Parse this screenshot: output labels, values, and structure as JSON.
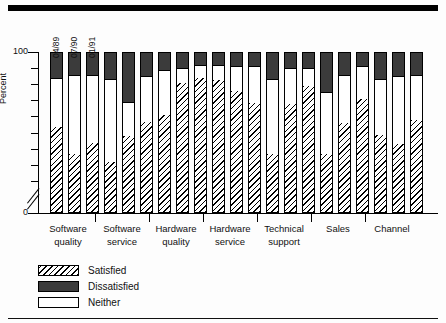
{
  "figure": {
    "y_axis_title": "Percent",
    "y_labels": [
      "100",
      "0"
    ],
    "series_dates": [
      "04/89",
      "07/90",
      "01/91"
    ],
    "legend": [
      {
        "key": "satisfied",
        "label": "Satisfied"
      },
      {
        "key": "dissatisfied",
        "label": "Dissatisfied"
      },
      {
        "key": "neither",
        "label": "Neither"
      }
    ],
    "colors": {
      "satisfied": "#000000",
      "dissatisfied": "#3b3b3b",
      "neither": "#ffffff",
      "axis": "#000000"
    }
  },
  "chart_data": {
    "type": "bar",
    "title": "",
    "subtitle": "",
    "xlabel": "",
    "ylabel": "Percent",
    "ylim": [
      0,
      100
    ],
    "y_ticks": [
      0,
      100
    ],
    "y_axis_broken": true,
    "grid": false,
    "stacked": true,
    "stack_total": 100,
    "legend_position": "below-left",
    "categories": [
      "Software quality",
      "Software service",
      "Hardware quality",
      "Hardware service",
      "Technical support",
      "Sales",
      "Channel"
    ],
    "category_lines": [
      [
        "Software",
        "quality"
      ],
      [
        "Software",
        "service"
      ],
      [
        "Hardware",
        "quality"
      ],
      [
        "Hardware",
        "service"
      ],
      [
        "Technical",
        "support"
      ],
      [
        "Sales",
        ""
      ],
      [
        "Channel",
        ""
      ]
    ],
    "sub_categories": [
      "04/89",
      "07/90",
      "01/91"
    ],
    "series": [
      {
        "name": "Satisfied",
        "values": [
          [
            53,
            36,
            43
          ],
          [
            31,
            47,
            56
          ],
          [
            60,
            80,
            83
          ],
          [
            82,
            75,
            68
          ],
          [
            36,
            67,
            78
          ],
          [
            36,
            55,
            70
          ],
          [
            48,
            42,
            57
          ]
        ]
      },
      {
        "name": "Neither",
        "values": [
          [
            31,
            50,
            43
          ],
          [
            52,
            22,
            29
          ],
          [
            29,
            10,
            9
          ],
          [
            10,
            16,
            23
          ],
          [
            47,
            23,
            12
          ],
          [
            39,
            31,
            21
          ],
          [
            35,
            43,
            29
          ]
        ]
      },
      {
        "name": "Dissatisfied",
        "values": [
          [
            16,
            14,
            14
          ],
          [
            17,
            31,
            15
          ],
          [
            11,
            10,
            8
          ],
          [
            8,
            9,
            9
          ],
          [
            17,
            10,
            10
          ],
          [
            25,
            14,
            9
          ],
          [
            17,
            15,
            14
          ]
        ]
      }
    ],
    "bars": [
      {
        "category": "Software quality",
        "date": "04/89",
        "satisfied": 53,
        "neither": 31,
        "dissatisfied": 16
      },
      {
        "category": "Software quality",
        "date": "07/90",
        "satisfied": 36,
        "neither": 50,
        "dissatisfied": 14
      },
      {
        "category": "Software quality",
        "date": "01/91",
        "satisfied": 43,
        "neither": 43,
        "dissatisfied": 14
      },
      {
        "category": "Software service",
        "date": "04/89",
        "satisfied": 31,
        "neither": 52,
        "dissatisfied": 17
      },
      {
        "category": "Software service",
        "date": "07/90",
        "satisfied": 47,
        "neither": 22,
        "dissatisfied": 31
      },
      {
        "category": "Software service",
        "date": "01/91",
        "satisfied": 56,
        "neither": 29,
        "dissatisfied": 15
      },
      {
        "category": "Hardware quality",
        "date": "04/89",
        "satisfied": 60,
        "neither": 29,
        "dissatisfied": 11
      },
      {
        "category": "Hardware quality",
        "date": "07/90",
        "satisfied": 80,
        "neither": 10,
        "dissatisfied": 10
      },
      {
        "category": "Hardware quality",
        "date": "01/91",
        "satisfied": 83,
        "neither": 9,
        "dissatisfied": 8
      },
      {
        "category": "Hardware service",
        "date": "04/89",
        "satisfied": 82,
        "neither": 10,
        "dissatisfied": 8
      },
      {
        "category": "Hardware service",
        "date": "07/90",
        "satisfied": 75,
        "neither": 16,
        "dissatisfied": 9
      },
      {
        "category": "Hardware service",
        "date": "01/91",
        "satisfied": 68,
        "neither": 23,
        "dissatisfied": 9
      },
      {
        "category": "Technical support",
        "date": "04/89",
        "satisfied": 36,
        "neither": 47,
        "dissatisfied": 17
      },
      {
        "category": "Technical support",
        "date": "07/90",
        "satisfied": 67,
        "neither": 23,
        "dissatisfied": 10
      },
      {
        "category": "Technical support",
        "date": "01/91",
        "satisfied": 78,
        "neither": 12,
        "dissatisfied": 10
      },
      {
        "category": "Sales",
        "date": "04/89",
        "satisfied": 36,
        "neither": 39,
        "dissatisfied": 25
      },
      {
        "category": "Sales",
        "date": "07/90",
        "satisfied": 55,
        "neither": 31,
        "dissatisfied": 14
      },
      {
        "category": "Sales",
        "date": "01/91",
        "satisfied": 70,
        "neither": 21,
        "dissatisfied": 9
      },
      {
        "category": "Channel",
        "date": "04/89",
        "satisfied": 48,
        "neither": 35,
        "dissatisfied": 17
      },
      {
        "category": "Channel",
        "date": "07/90",
        "satisfied": 42,
        "neither": 43,
        "dissatisfied": 15
      },
      {
        "category": "Channel",
        "date": "01/91",
        "satisfied": 57,
        "neither": 29,
        "dissatisfied": 14
      }
    ]
  }
}
